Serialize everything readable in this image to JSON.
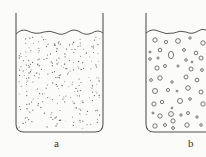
{
  "diagram": {
    "type": "beaker-comparison",
    "colors": {
      "background": "#fbfbfa",
      "stroke": "#555555",
      "particle": "#666666"
    },
    "beakers": [
      {
        "id": "a",
        "label": "a",
        "content": "small-dots",
        "description": "Beaker with liquid containing many small dispersed dots"
      },
      {
        "id": "b",
        "label": "b",
        "content": "bubbles",
        "description": "Beaker with liquid containing small hollow circles (bubbles)"
      }
    ]
  }
}
